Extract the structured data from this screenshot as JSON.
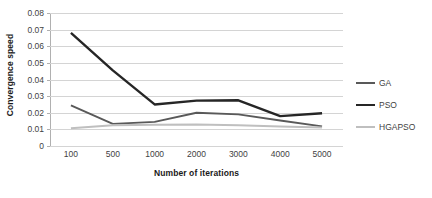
{
  "chart_data": {
    "type": "line",
    "title": "",
    "xlabel": "Number of iterations",
    "ylabel": "Convergence speed",
    "categories": [
      "100",
      "500",
      "1000",
      "2000",
      "3000",
      "4000",
      "5000"
    ],
    "ylim": [
      0,
      0.08
    ],
    "ytick_labels": [
      "0.08",
      "0.07",
      "0.06",
      "0.05",
      "0.04",
      "0.03",
      "0.02",
      "0.01",
      "0"
    ],
    "ytick_values": [
      0.08,
      0.07,
      0.06,
      0.05,
      0.04,
      0.03,
      0.02,
      0.01,
      0
    ],
    "grid": true,
    "legend_position": "right",
    "series": [
      {
        "name": "GA",
        "color": "#595959",
        "values": [
          0.0245,
          0.0133,
          0.0145,
          0.02,
          0.019,
          0.0153,
          0.0118
        ]
      },
      {
        "name": "PSO",
        "color": "#262626",
        "values": [
          0.068,
          0.0455,
          0.025,
          0.0273,
          0.0275,
          0.018,
          0.0197
        ]
      },
      {
        "name": "HGAPSO",
        "color": "#BFBFBF",
        "values": [
          0.0107,
          0.0125,
          0.0128,
          0.013,
          0.0125,
          0.0118,
          0.0112
        ]
      }
    ]
  }
}
